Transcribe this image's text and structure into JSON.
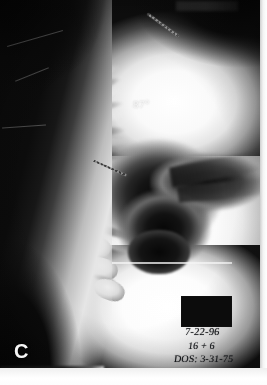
{
  "figure": {
    "type": "radiograph",
    "view": "lateral thoracolumbar spine",
    "panel_label": "C",
    "background_color": "#0d0d0d"
  },
  "annotations": {
    "angle_measurement": "87°",
    "angle_color": "#ffffff",
    "panel_letter": "C",
    "pointer_markers": [
      {
        "name": "upper-marker",
        "description": "diagonal radiopaque marker upper field"
      },
      {
        "name": "mid-marker",
        "description": "thin diagonal pointer mid field"
      }
    ]
  },
  "id_stamp": {
    "masked_block": "",
    "date": "7-22-96",
    "gestation": "16 + 6",
    "dos_label": "DOS:",
    "dos_value": "3-31-75",
    "dos_line": "DOS: 3-31-75",
    "ink_color": "#14161a"
  },
  "film": {
    "margin_color": "#ffffff",
    "emulsion_dark": "#0a0a0a",
    "bone_bright": "#f2f2f2"
  },
  "anatomy": {
    "vertebrae": [
      {
        "x": 62,
        "y": 62,
        "w": 26,
        "h": 17,
        "rot": -52
      },
      {
        "x": 56,
        "y": 78,
        "w": 27,
        "h": 17,
        "rot": -44
      },
      {
        "x": 52,
        "y": 95,
        "w": 28,
        "h": 18,
        "rot": -34
      },
      {
        "x": 50,
        "y": 113,
        "w": 29,
        "h": 18,
        "rot": -24
      },
      {
        "x": 50,
        "y": 132,
        "w": 30,
        "h": 19,
        "rot": -15
      },
      {
        "x": 53,
        "y": 152,
        "w": 31,
        "h": 19,
        "rot": -8
      },
      {
        "x": 58,
        "y": 172,
        "w": 32,
        "h": 20,
        "rot": -3
      },
      {
        "x": 64,
        "y": 193,
        "w": 33,
        "h": 20,
        "rot": 3
      },
      {
        "x": 71,
        "y": 214,
        "w": 33,
        "h": 21,
        "rot": 8
      },
      {
        "x": 78,
        "y": 236,
        "w": 33,
        "h": 21,
        "rot": 12
      },
      {
        "x": 86,
        "y": 258,
        "w": 32,
        "h": 21,
        "rot": 16
      },
      {
        "x": 94,
        "y": 280,
        "w": 31,
        "h": 20,
        "rot": 20
      }
    ],
    "ribs": [
      {
        "x": 70,
        "y": 70,
        "w": 52,
        "h": 8,
        "rot": -18
      },
      {
        "x": 66,
        "y": 92,
        "w": 58,
        "h": 8,
        "rot": -12
      },
      {
        "x": 64,
        "y": 114,
        "w": 62,
        "h": 9,
        "rot": -7
      },
      {
        "x": 64,
        "y": 138,
        "w": 64,
        "h": 9,
        "rot": -2
      },
      {
        "x": 68,
        "y": 162,
        "w": 62,
        "h": 9,
        "rot": 4
      },
      {
        "x": 74,
        "y": 188,
        "w": 58,
        "h": 9,
        "rot": 9
      },
      {
        "x": 80,
        "y": 214,
        "w": 54,
        "h": 9,
        "rot": 14
      },
      {
        "x": 88,
        "y": 240,
        "w": 48,
        "h": 9,
        "rot": 18
      }
    ],
    "rib_shadows": [
      {
        "x": 74,
        "y": 82,
        "w": 48,
        "h": 7,
        "rot": -15
      },
      {
        "x": 70,
        "y": 104,
        "w": 54,
        "h": 7,
        "rot": -9
      },
      {
        "x": 70,
        "y": 128,
        "w": 56,
        "h": 8,
        "rot": -4
      },
      {
        "x": 74,
        "y": 152,
        "w": 54,
        "h": 8,
        "rot": 2
      },
      {
        "x": 80,
        "y": 176,
        "w": 50,
        "h": 8,
        "rot": 7
      },
      {
        "x": 86,
        "y": 202,
        "w": 46,
        "h": 8,
        "rot": 12
      },
      {
        "x": 92,
        "y": 228,
        "w": 42,
        "h": 8,
        "rot": 16
      }
    ],
    "scratches": [
      {
        "x": 6,
        "y": 38,
        "w": 58,
        "rot": -16
      },
      {
        "x": 2,
        "y": 126,
        "w": 44,
        "rot": -4
      },
      {
        "x": 14,
        "y": 74,
        "w": 36,
        "rot": -22
      }
    ]
  }
}
